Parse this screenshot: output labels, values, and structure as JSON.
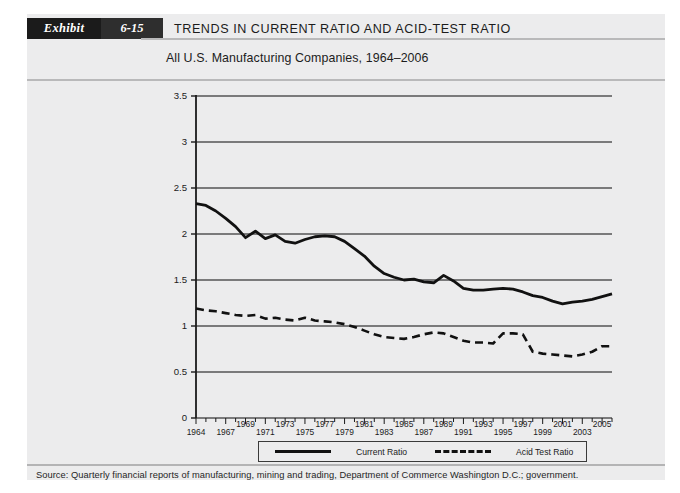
{
  "header": {
    "exhibit_label": "Exhibit",
    "exhibit_number": "6-15",
    "title": "TRENDS IN CURRENT RATIO AND ACID-TEST RATIO"
  },
  "subtitle": "All U.S. Manufacturing Companies, 1964–2006",
  "legend": {
    "current_ratio_label": "Current Ratio",
    "acid_test_label": "Acid Test Ratio"
  },
  "source": "Source: Quarterly financial reports of manufacturing, mining and trading, Department of Commerce Washington D.C.; government.",
  "colors": {
    "panel": "#ececed",
    "line": "#111111",
    "grid": "#555555",
    "axis": "#1b1b1b",
    "header_dark": "#1b1b1b",
    "header_num": "#2e2e2e"
  },
  "chart_data": {
    "type": "line",
    "title": "TRENDS IN CURRENT RATIO AND ACID-TEST RATIO",
    "subtitle": "All U.S. Manufacturing Companies, 1964–2006",
    "xlabel": "",
    "ylabel": "",
    "ylim": [
      0,
      3.5
    ],
    "yticks": [
      0,
      0.5,
      1,
      1.5,
      2,
      2.5,
      3,
      3.5
    ],
    "ytick_labels": [
      "0",
      "0.5",
      "1",
      "1.5",
      "2",
      "2.5",
      "3",
      "3.5"
    ],
    "grid": true,
    "legend_position": "bottom",
    "x": [
      1964,
      1965,
      1966,
      1967,
      1968,
      1969,
      1970,
      1971,
      1972,
      1973,
      1974,
      1975,
      1976,
      1977,
      1978,
      1979,
      1980,
      1981,
      1982,
      1983,
      1984,
      1985,
      1986,
      1987,
      1988,
      1989,
      1990,
      1991,
      1992,
      1993,
      1994,
      1995,
      1996,
      1997,
      1998,
      1999,
      2000,
      2001,
      2002,
      2003,
      2004,
      2005,
      2006
    ],
    "xtick_labels_lower": [
      "1964",
      "1967",
      "1971",
      "1975",
      "1979",
      "1983",
      "1987",
      "1991",
      "1995",
      "1999",
      "2003"
    ],
    "xtick_labels_upper": [
      "1969",
      "1973",
      "1977",
      "1981",
      "1985",
      "1989",
      "1993",
      "1997",
      "2001",
      "2005"
    ],
    "xtick_years": [
      1964,
      1967,
      1969,
      1971,
      1973,
      1975,
      1977,
      1979,
      1981,
      1983,
      1985,
      1987,
      1989,
      1991,
      1993,
      1995,
      1997,
      1999,
      2001,
      2003,
      2005
    ],
    "series": [
      {
        "name": "Current Ratio",
        "style": "solid",
        "values": [
          2.33,
          2.31,
          2.25,
          2.17,
          2.08,
          1.96,
          2.03,
          1.95,
          1.99,
          1.92,
          1.9,
          1.94,
          1.97,
          1.98,
          1.97,
          1.92,
          1.84,
          1.76,
          1.65,
          1.57,
          1.53,
          1.5,
          1.51,
          1.48,
          1.47,
          1.55,
          1.49,
          1.41,
          1.39,
          1.39,
          1.4,
          1.41,
          1.4,
          1.37,
          1.33,
          1.31,
          1.27,
          1.24,
          1.26,
          1.27,
          1.29,
          1.32,
          1.35
        ]
      },
      {
        "name": "Acid Test Ratio",
        "style": "dashed",
        "values": [
          1.19,
          1.17,
          1.16,
          1.14,
          1.12,
          1.11,
          1.12,
          1.08,
          1.09,
          1.07,
          1.06,
          1.09,
          1.06,
          1.05,
          1.04,
          1.02,
          0.99,
          0.95,
          0.91,
          0.88,
          0.87,
          0.86,
          0.88,
          0.91,
          0.93,
          0.92,
          0.88,
          0.84,
          0.82,
          0.82,
          0.81,
          0.92,
          0.92,
          0.91,
          0.72,
          0.7,
          0.69,
          0.68,
          0.67,
          0.69,
          0.72,
          0.78,
          0.78
        ]
      }
    ]
  }
}
